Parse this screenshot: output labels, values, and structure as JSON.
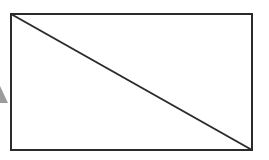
{
  "figure": {
    "title": "Rectangle with diagonal",
    "canvas": {
      "width": 269,
      "height": 160,
      "background_color": "#ffffff"
    },
    "shapes": {
      "rectangle": {
        "name": "rectangle",
        "x": 11,
        "y": 14,
        "width": 241,
        "height": 136,
        "stroke_color": "#2b2b2b",
        "stroke_width": 2,
        "fill_color": "#ffffff",
        "corners": {
          "top_left": [
            11,
            14
          ],
          "top_right": [
            252,
            14
          ],
          "bottom_right": [
            252,
            150
          ],
          "bottom_left": [
            11,
            150
          ]
        }
      },
      "diagonal": {
        "name": "diagonal-line",
        "x1": 11,
        "y1": 14,
        "x2": 252,
        "y2": 150,
        "stroke_color": "#2b2b2b",
        "stroke_width": 2,
        "from_corner": "top-left",
        "to_corner": "bottom-right"
      },
      "edge_marker": {
        "name": "clipped-arrowhead-fragment",
        "description": "Small faint triangular wedge clipped by the left image border",
        "x": 0,
        "y": 86,
        "width": 8,
        "height": 17,
        "fill_color": "#8a8a8a",
        "opacity": 0.85
      }
    }
  }
}
